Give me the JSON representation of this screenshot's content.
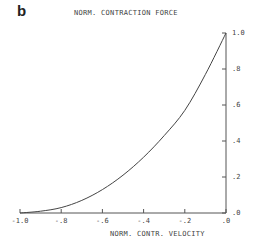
{
  "panel_label": "b",
  "chart_data": {
    "type": "line",
    "title": "NORM. CONTRACTION FORCE",
    "xlabel": "NORM. CONTR. VELOCITY",
    "ylabel": "NORM. CONTRACTION FORCE",
    "xlim": [
      -1.0,
      0.0
    ],
    "ylim": [
      0.0,
      1.0
    ],
    "x_ticks": [
      "-1.0",
      "-.8",
      "-.6",
      "-.4",
      "-.2",
      ".0"
    ],
    "y_ticks": [
      ".0",
      ".2",
      ".4",
      ".6",
      ".8",
      "1.0"
    ],
    "grid": false,
    "y_axis_position": "right",
    "series": [
      {
        "name": "force-velocity",
        "x": [
          -1.0,
          -0.9,
          -0.8,
          -0.7,
          -0.6,
          -0.5,
          -0.4,
          -0.3,
          -0.2,
          -0.1,
          0.0
        ],
        "y": [
          0.0,
          0.01,
          0.03,
          0.07,
          0.13,
          0.21,
          0.31,
          0.43,
          0.57,
          0.77,
          1.0
        ]
      }
    ]
  }
}
